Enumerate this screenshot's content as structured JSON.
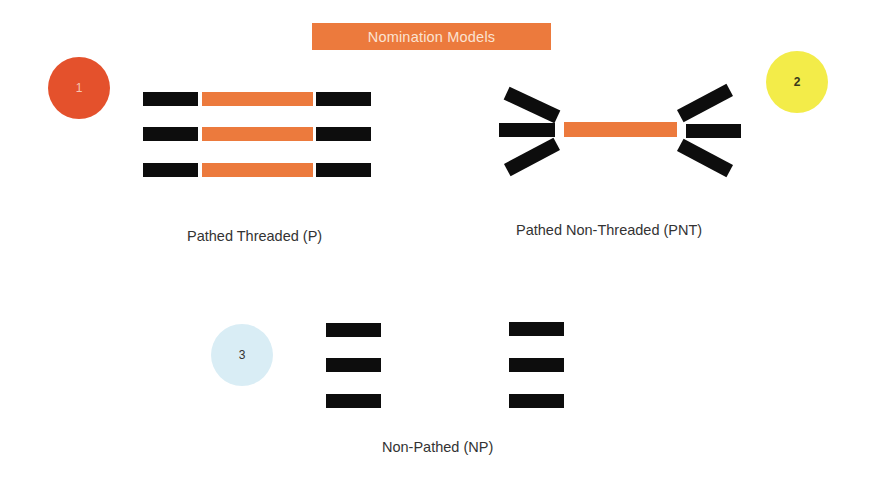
{
  "title": "Nomination Models",
  "colors": {
    "accent_orange": "#ec7a3d",
    "bar_black": "#0d0d0d",
    "badge_1": "#e4512c",
    "badge_2": "#f3ec49",
    "badge_3": "#d9edf5",
    "label_text": "#333333"
  },
  "models": [
    {
      "number": "1",
      "label": "Pathed Threaded (P)"
    },
    {
      "number": "2",
      "label": "Pathed Non-Threaded (PNT)"
    },
    {
      "number": "3",
      "label": "Non-Pathed (NP)"
    }
  ]
}
